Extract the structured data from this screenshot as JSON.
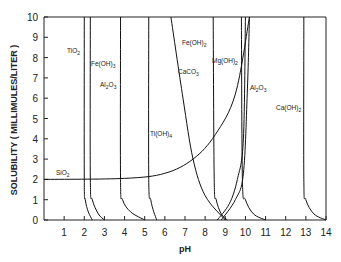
{
  "chart_data": {
    "type": "line",
    "title": "",
    "xlabel": "pH",
    "ylabel": "SOLUBILITY ( MILLIMULES/LITER )",
    "xlim": [
      0,
      14
    ],
    "ylim": [
      0,
      10
    ],
    "xticks": [
      1,
      2,
      3,
      4,
      5,
      6,
      7,
      8,
      9,
      10,
      11,
      12,
      13,
      14
    ],
    "yticks": [
      0,
      1,
      2,
      3,
      4,
      5,
      6,
      7,
      8,
      9,
      10
    ],
    "grid": false,
    "legend": "inline labels",
    "series": [
      {
        "name": "TiO2",
        "label_pos": [
          1.6,
          8.3
        ],
        "points": [
          [
            2.0,
            10
          ],
          [
            2.0,
            2
          ],
          [
            2.05,
            1
          ],
          [
            2.2,
            0.4
          ],
          [
            2.4,
            0
          ]
        ]
      },
      {
        "name": "Fe(OH)3",
        "label_pos": [
          2.6,
          7.6
        ],
        "points": [
          [
            2.3,
            10
          ],
          [
            2.3,
            2
          ],
          [
            2.4,
            1
          ],
          [
            2.7,
            0.3
          ],
          [
            3.0,
            0
          ]
        ]
      },
      {
        "name": "Al2O3",
        "label_pos": [
          3.7,
          6.7
        ],
        "points": [
          [
            3.8,
            10
          ],
          [
            3.8,
            2
          ],
          [
            3.9,
            1
          ],
          [
            4.3,
            0.4
          ],
          [
            5.0,
            0
          ]
        ]
      },
      {
        "name": "Ti(OH)4",
        "label_pos": [
          6.0,
          3.8
        ],
        "points": [
          [
            5.2,
            10
          ],
          [
            5.2,
            2
          ],
          [
            5.3,
            1
          ],
          [
            5.45,
            0.4
          ],
          [
            5.6,
            0
          ]
        ]
      },
      {
        "name": "CaCO3",
        "label_pos": [
          6.9,
          7.7
        ],
        "points": [
          [
            6.3,
            10
          ],
          [
            6.9,
            6
          ],
          [
            7.4,
            3
          ],
          [
            8.0,
            1.2
          ],
          [
            9.0,
            0
          ]
        ]
      },
      {
        "name": "Fe(OH)2",
        "label_pos": [
          7.4,
          8.7
        ],
        "points": [
          [
            8.4,
            10
          ],
          [
            8.45,
            2
          ],
          [
            8.55,
            1
          ],
          [
            8.8,
            0.3
          ],
          [
            9.1,
            0
          ]
        ]
      },
      {
        "name": "Mg(OH)2",
        "label_pos": [
          8.7,
          8.2
        ],
        "points": [
          [
            10.0,
            10
          ],
          [
            9.9,
            4
          ],
          [
            9.6,
            2
          ],
          [
            9.2,
            0.8
          ],
          [
            8.6,
            0
          ]
        ]
      },
      {
        "name": "Al2O3",
        "label_pos": [
          10.1,
          5.7
        ],
        "points": [
          [
            8.8,
            0
          ],
          [
            9.5,
            1
          ],
          [
            9.9,
            2.3
          ],
          [
            10.1,
            6.5
          ],
          [
            10.2,
            10
          ]
        ]
      },
      {
        "name": "Al2O3",
        "points": [
          [
            9.8,
            10
          ],
          [
            9.85,
            2
          ],
          [
            10.0,
            1
          ],
          [
            10.4,
            0.3
          ],
          [
            11.0,
            0
          ]
        ]
      },
      {
        "name": "SiO2",
        "label_pos": [
          0.3,
          2.25
        ],
        "points": [
          [
            0,
            2.0
          ],
          [
            4,
            2.05
          ],
          [
            6,
            2.3
          ],
          [
            7.4,
            3.0
          ],
          [
            8.5,
            4.2
          ],
          [
            9.5,
            6.2
          ],
          [
            10.2,
            10
          ]
        ]
      },
      {
        "name": "Ca(OH)2",
        "label_pos": [
          12.2,
          5.1
        ],
        "points": [
          [
            12.9,
            10
          ],
          [
            12.9,
            2
          ],
          [
            13.0,
            1
          ],
          [
            13.4,
            0.3
          ],
          [
            14.0,
            0
          ]
        ]
      }
    ]
  },
  "labels": {
    "xlabel": "pH",
    "ylabel": "SOLUBILITY ( MILLIMULES/LITER )",
    "x_ticks": [
      "1",
      "2",
      "3",
      "4",
      "5",
      "6",
      "7",
      "8",
      "9",
      "10",
      "11",
      "12",
      "13",
      "14"
    ],
    "y_ticks": [
      "0",
      "1",
      "2",
      "3",
      "4",
      "5",
      "6",
      "7",
      "8",
      "9",
      "10"
    ],
    "series": {
      "tio2": {
        "base": "TiO",
        "sub": "2"
      },
      "feoh3": {
        "base": "Fe(OH)",
        "sub": "3"
      },
      "al2o3_left": {
        "a": "Al",
        "s1": "2",
        "b": "O",
        "s2": "3"
      },
      "tioh4": {
        "base": "Ti(OH)",
        "sub": "4"
      },
      "caco3": {
        "base": "CaCO",
        "sub": "3"
      },
      "feoh2": {
        "base": "Fe(OH)",
        "sub": "2"
      },
      "mgoh2": {
        "base": "Mg(OH)",
        "sub": "2"
      },
      "al2o3_right": {
        "a": "Al",
        "s1": "2",
        "b": "O",
        "s2": "3"
      },
      "sio2": {
        "base": "SiO",
        "sub": "2"
      },
      "caoh2": {
        "base": "Ca(OH)",
        "sub": "2"
      }
    }
  }
}
